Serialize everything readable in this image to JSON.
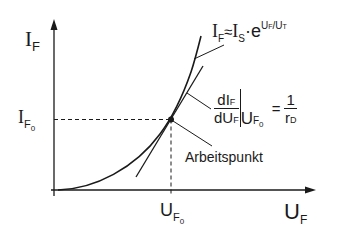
{
  "diagram": {
    "y_axis": {
      "symbol": "I",
      "subscript": "F"
    },
    "x_axis": {
      "symbol": "U",
      "subscript": "F"
    },
    "y_tick": {
      "symbol": "I",
      "subscript": "F",
      "subsub": "0"
    },
    "x_tick": {
      "symbol": "U",
      "subscript": "F",
      "subsub": "0"
    },
    "equation": {
      "lhs": "I",
      "lhs_sub": "F",
      "approx": "≈",
      "rhs": "I",
      "rhs_sub": "S",
      "dot": "·",
      "base": "e",
      "exponent": "U",
      "exponent_sub": "F",
      "exponent_slash": "/U",
      "exponent_sub2": "T"
    },
    "derivative": {
      "num": "dI",
      "num_sub": "F",
      "den": "dU",
      "den_sub": "F",
      "eval": "U",
      "eval_sub": "F",
      "eval_subsub": "0",
      "equals": "=",
      "rhs_num": "1",
      "rhs_den": "r",
      "rhs_den_sub": "D"
    },
    "annotation": "Arbeitspunkt",
    "colors": {
      "line": "#1a1a1a",
      "background": "#ffffff"
    }
  }
}
